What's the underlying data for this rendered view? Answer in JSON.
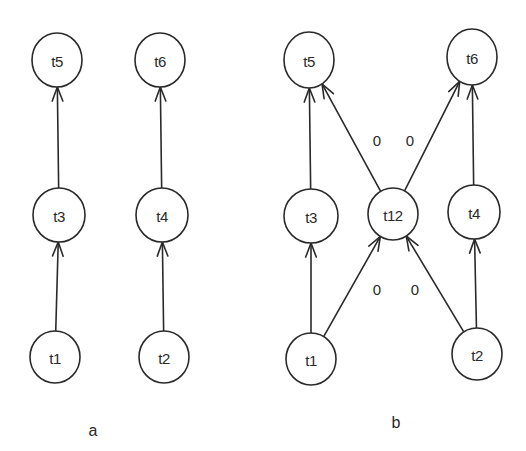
{
  "style": {
    "stroke_color": "#2a2a2a",
    "background": "#ffffff"
  },
  "diagrams": [
    {
      "id": "a",
      "caption": "a",
      "caption_pos": [
        93,
        430
      ],
      "nodes": [
        {
          "id": "t5",
          "label": "t5",
          "cx": 57,
          "cy": 60,
          "rx": 25,
          "ry": 27
        },
        {
          "id": "t6",
          "label": "t6",
          "cx": 160,
          "cy": 60,
          "rx": 25,
          "ry": 27
        },
        {
          "id": "t3",
          "label": "t3",
          "cx": 59,
          "cy": 215,
          "rx": 26,
          "ry": 27
        },
        {
          "id": "t4",
          "label": "t4",
          "cx": 162,
          "cy": 215,
          "rx": 26,
          "ry": 27
        },
        {
          "id": "t1",
          "label": "t1",
          "cx": 55,
          "cy": 357,
          "rx": 25,
          "ry": 26
        },
        {
          "id": "t2",
          "label": "t2",
          "cx": 164,
          "cy": 357,
          "rx": 25,
          "ry": 26
        }
      ],
      "edges": [
        {
          "from": "t1",
          "to": "t3",
          "weight": ""
        },
        {
          "from": "t3",
          "to": "t5",
          "weight": ""
        },
        {
          "from": "t2",
          "to": "t4",
          "weight": ""
        },
        {
          "from": "t4",
          "to": "t6",
          "weight": ""
        }
      ]
    },
    {
      "id": "b",
      "caption": "b",
      "caption_pos": [
        396,
        422
      ],
      "nodes": [
        {
          "id": "t5",
          "label": "t5",
          "cx": 309,
          "cy": 60,
          "rx": 25,
          "ry": 28
        },
        {
          "id": "t6",
          "label": "t6",
          "cx": 472,
          "cy": 57,
          "rx": 25,
          "ry": 28
        },
        {
          "id": "t3",
          "label": "t3",
          "cx": 311,
          "cy": 216,
          "rx": 27,
          "ry": 27
        },
        {
          "id": "t12",
          "label": "t12",
          "cx": 393,
          "cy": 214,
          "rx": 25,
          "ry": 26
        },
        {
          "id": "t4",
          "label": "t4",
          "cx": 474,
          "cy": 212,
          "rx": 26,
          "ry": 27
        },
        {
          "id": "t1",
          "label": "t1",
          "cx": 311,
          "cy": 359,
          "rx": 25,
          "ry": 26
        },
        {
          "id": "t2",
          "label": "t2",
          "cx": 477,
          "cy": 354,
          "rx": 25,
          "ry": 26
        }
      ],
      "edges": [
        {
          "from": "t1",
          "to": "t3",
          "weight": ""
        },
        {
          "from": "t3",
          "to": "t5",
          "weight": ""
        },
        {
          "from": "t2",
          "to": "t4",
          "weight": ""
        },
        {
          "from": "t4",
          "to": "t6",
          "weight": ""
        },
        {
          "from": "t12",
          "to": "t5",
          "weight": "0",
          "weight_pos": [
            377,
            140
          ]
        },
        {
          "from": "t12",
          "to": "t6",
          "weight": "0",
          "weight_pos": [
            410,
            140
          ]
        },
        {
          "from": "t1",
          "to": "t12",
          "weight": "0",
          "weight_pos": [
            377,
            289
          ]
        },
        {
          "from": "t2",
          "to": "t12",
          "weight": "0",
          "weight_pos": [
            415,
            289
          ]
        }
      ]
    }
  ]
}
